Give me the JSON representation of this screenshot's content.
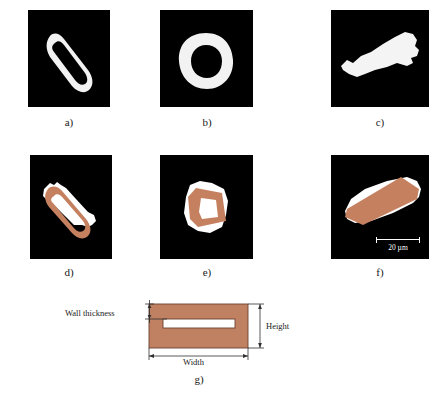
{
  "figure": {
    "rows": [
      {
        "panels": [
          {
            "caption": "a)",
            "kind": "binary-threshold",
            "shape": "elongated-hollow-rectangle-outline",
            "fill": "#ffffff",
            "background": "#000000"
          },
          {
            "caption": "b)",
            "kind": "binary-threshold",
            "shape": "square-hollow-ring-outline",
            "fill": "#ffffff",
            "background": "#000000"
          },
          {
            "caption": "c)",
            "kind": "binary-threshold",
            "shape": "solid-irregular-elongated-blob",
            "fill": "#ffffff",
            "background": "#000000"
          }
        ]
      },
      {
        "panels": [
          {
            "caption": "d)",
            "kind": "color-overlay",
            "shape": "elongated-hollow-rectangle-outline",
            "fill": "#c5815f",
            "background": "#000000"
          },
          {
            "caption": "e)",
            "kind": "color-overlay",
            "shape": "square-hollow-ring-outline",
            "fill": "#c5815f",
            "background": "#000000"
          },
          {
            "caption": "f)",
            "kind": "color-overlay",
            "shape": "solid-filled-rectangle",
            "fill": "#c5815f",
            "background": "#000000"
          }
        ]
      }
    ],
    "scalebar": {
      "label": "20 µm",
      "color": "#ffffff"
    },
    "schematic": {
      "caption": "g)",
      "fill": "#c08163",
      "stroke": "#6b4030",
      "lumen_fill": "#ffffff",
      "labels": {
        "wall_thickness": "Wall thickness",
        "height": "Height",
        "width": "Width"
      }
    },
    "colors": {
      "overlay": "#c5815f",
      "schematic_fill": "#c08163",
      "panel_background": "#000000",
      "binary_fill": "#ffffff",
      "text": "#1a1a1a"
    }
  }
}
